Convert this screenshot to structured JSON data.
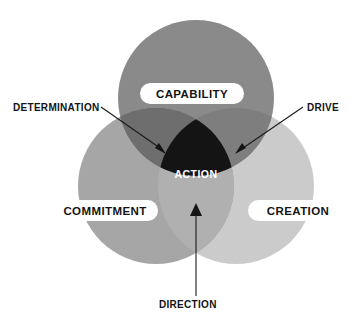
{
  "diagram": {
    "type": "venn-3-circle",
    "circles": [
      {
        "id": "capability",
        "label": "CAPABILITY",
        "cx": 196,
        "cy": 98,
        "r": 78,
        "color": "#8a8a8a"
      },
      {
        "id": "commitment",
        "label": "COMMITMENT",
        "cx": 156,
        "cy": 186,
        "r": 78,
        "color": "#a6a6a6"
      },
      {
        "id": "creation",
        "label": "CREATION",
        "cx": 236,
        "cy": 186,
        "r": 78,
        "color": "#cbcbcb"
      }
    ],
    "center": {
      "id": "action",
      "label": "ACTION",
      "color": "#141414",
      "text_color": "#ffffff"
    },
    "overlaps": [
      {
        "id": "capability-commitment",
        "label": "DETERMINATION",
        "color": "#6e6e6e"
      },
      {
        "id": "capability-creation",
        "label": "DRIVE",
        "color": "#7e7e7e"
      },
      {
        "id": "commitment-creation",
        "label": "DIRECTION",
        "color": "#b0b0b0"
      }
    ],
    "callouts": [
      {
        "id": "determination",
        "label": "DETERMINATION",
        "target_x": 163,
        "target_y": 152
      },
      {
        "id": "drive",
        "label": "DRIVE",
        "target_x": 238,
        "target_y": 152
      },
      {
        "id": "direction",
        "label": "DIRECTION",
        "target_x": 196,
        "target_y": 205
      }
    ],
    "background": "#ffffff",
    "line_color": "#1a1a1a"
  }
}
